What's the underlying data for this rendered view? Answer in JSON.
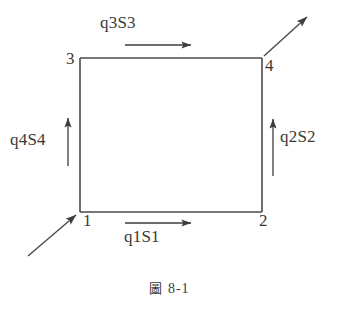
{
  "figure": {
    "caption_cjk": "圖",
    "caption_number": "8-1",
    "background_color": "#ffffff",
    "line_color": "#4a4a4a",
    "text_color": "#3a3a3a"
  },
  "vertices": [
    {
      "id": "1",
      "label": "1",
      "position": "bottom-left"
    },
    {
      "id": "2",
      "label": "2",
      "position": "bottom-right"
    },
    {
      "id": "3",
      "label": "3",
      "position": "top-left"
    },
    {
      "id": "4",
      "label": "4",
      "position": "top-right"
    }
  ],
  "flows": [
    {
      "id": "q1",
      "label": "q1S1",
      "edge": "bottom",
      "direction": "right",
      "from": "1",
      "to": "2"
    },
    {
      "id": "q2",
      "label": "q2S2",
      "edge": "right",
      "direction": "up",
      "from": "2",
      "to": "4"
    },
    {
      "id": "q3",
      "label": "q3S3",
      "edge": "top",
      "direction": "right",
      "from": "3",
      "to": "4"
    },
    {
      "id": "q4",
      "label": "q4S4",
      "edge": "left",
      "direction": "up",
      "from": "1",
      "to": "3"
    }
  ],
  "external_arrows": [
    {
      "id": "inflow",
      "target": "1",
      "direction": "up-right",
      "description": "incoming arrow into vertex 1"
    },
    {
      "id": "outflow",
      "source": "4",
      "direction": "up-right",
      "description": "outgoing arrow from vertex 4"
    }
  ]
}
